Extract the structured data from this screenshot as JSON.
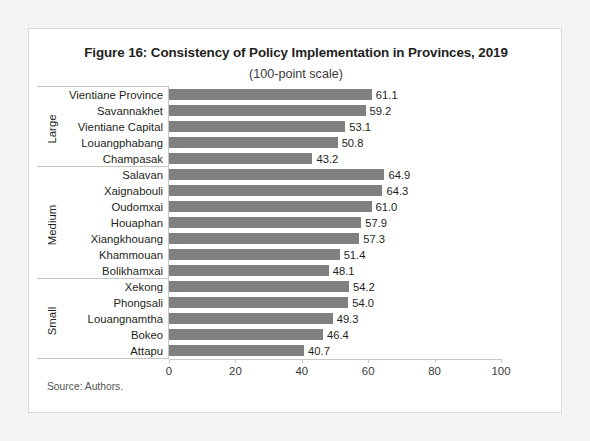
{
  "figure": {
    "title": "Figure 16: Consistency of Policy Implementation in Provinces, 2019",
    "subtitle": "(100-point scale)",
    "source": "Source: Authors."
  },
  "chart_data": {
    "type": "bar",
    "orientation": "horizontal",
    "title": "Figure 16: Consistency of Policy Implementation in Provinces, 2019",
    "subtitle": "(100-point scale)",
    "xlabel": "",
    "ylabel": "",
    "xlim": [
      0,
      100
    ],
    "xticks": [
      "0",
      "20",
      "40",
      "60",
      "80",
      "100"
    ],
    "grid": false,
    "legend": false,
    "bar_color": "#808080",
    "categories": [
      "Vientiane Province",
      "Savannakhet",
      "Vientiane Capital",
      "Louangphabang",
      "Champasak",
      "Salavan",
      "Xaignabouli",
      "Oudomxai",
      "Houaphan",
      "Xiangkhouang",
      "Khammouan",
      "Bolikhamxai",
      "Xekong",
      "Phongsali",
      "Louangnamtha",
      "Bokeo",
      "Attapu"
    ],
    "values": [
      61.1,
      59.2,
      53.1,
      50.8,
      43.2,
      64.9,
      64.3,
      61.0,
      57.9,
      57.3,
      51.4,
      48.1,
      54.2,
      54.0,
      49.3,
      46.4,
      40.7
    ],
    "value_labels": [
      "61.1",
      "59.2",
      "53.1",
      "50.8",
      "43.2",
      "64.9",
      "64.3",
      "61.0",
      "57.9",
      "57.3",
      "51.4",
      "48.1",
      "54.2",
      "54.0",
      "49.3",
      "46.4",
      "40.7"
    ],
    "groups": [
      {
        "label": "Large",
        "start": 0,
        "count": 5
      },
      {
        "label": "Medium",
        "start": 5,
        "count": 7
      },
      {
        "label": "Small",
        "start": 12,
        "count": 5
      }
    ]
  }
}
